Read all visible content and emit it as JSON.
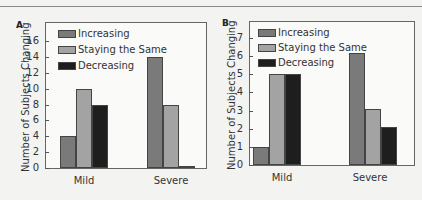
{
  "colors": {
    "increasing": "#7a7a7a",
    "staying": "#a3a3a3",
    "decreasing": "#1e1e1e",
    "background": "#f3f3f1"
  },
  "chart_data": [
    {
      "panel": "A",
      "type": "bar",
      "title": "",
      "xlabel": "",
      "ylabel": "Number of Subjects Changing",
      "categories": [
        "Mild",
        "Severe"
      ],
      "series": [
        {
          "name": "Increasing",
          "values": [
            4,
            14
          ]
        },
        {
          "name": "Staying the Same",
          "values": [
            10,
            8
          ]
        },
        {
          "name": "Decreasing",
          "values": [
            8,
            0.3
          ]
        }
      ],
      "yticks": [
        0,
        2,
        4,
        6,
        8,
        10,
        12,
        14,
        16
      ],
      "ylim": [
        0,
        17
      ],
      "grid": false,
      "legend_position": "upper left"
    },
    {
      "panel": "B",
      "type": "bar",
      "title": "",
      "xlabel": "",
      "ylabel": "Number of Subjects Changing",
      "categories": [
        "Mild",
        "Severe"
      ],
      "series": [
        {
          "name": "Increasing",
          "values": [
            1,
            6.2
          ]
        },
        {
          "name": "Staying the Same",
          "values": [
            5,
            3.1
          ]
        },
        {
          "name": "Decreasing",
          "values": [
            5,
            2.1
          ]
        }
      ],
      "yticks": [
        0,
        1,
        2,
        3,
        4,
        5,
        6,
        7
      ],
      "ylim": [
        0,
        7.5
      ],
      "grid": false,
      "legend_position": "upper left"
    }
  ],
  "panels": [
    {
      "letter": "A",
      "ylabel": "Number of Subjects Changing",
      "legend": [
        "Increasing",
        "Staying the Same",
        "Decreasing"
      ],
      "categories": [
        "Mild",
        "Severe"
      ]
    },
    {
      "letter": "B",
      "ylabel": "Number of Subjects Changing",
      "legend": [
        "Increasing",
        "Staying the Same",
        "Decreasing"
      ],
      "categories": [
        "Mild",
        "Severe"
      ]
    }
  ]
}
